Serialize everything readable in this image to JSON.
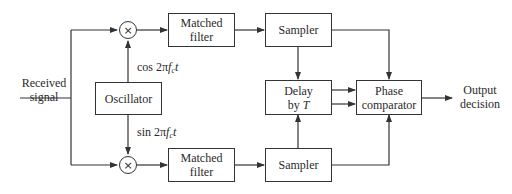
{
  "diagram": {
    "input_label": {
      "line1": "Received",
      "line2": "signal"
    },
    "output_label": {
      "line1": "Output",
      "line2": "decision"
    },
    "oscillator": {
      "label": "Oscillator"
    },
    "cos_label": {
      "prefix": "cos 2π",
      "f": "f",
      "sub": "c",
      "t": "t"
    },
    "sin_label": {
      "prefix": "sin 2π",
      "f": "f",
      "sub": "c",
      "t": "t"
    },
    "mixer_symbol": "×",
    "top_branch": {
      "matched_filter": {
        "line1": "Matched",
        "line2": "filter"
      },
      "sampler": {
        "label": "Sampler"
      }
    },
    "bottom_branch": {
      "matched_filter": {
        "line1": "Matched",
        "line2": "filter"
      },
      "sampler": {
        "label": "Sampler"
      }
    },
    "delay": {
      "line1": "Delay",
      "line2_prefix": "by ",
      "line2_var": "T"
    },
    "phase_comparator": {
      "line1": "Phase",
      "line2": "comparator"
    }
  }
}
